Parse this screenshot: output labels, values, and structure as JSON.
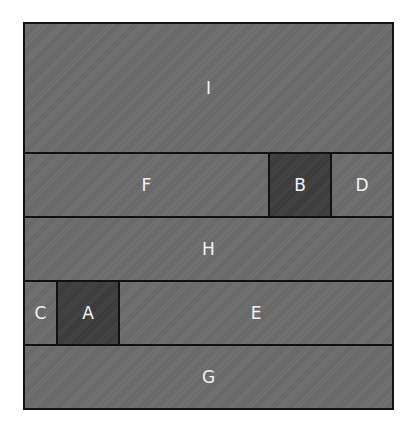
{
  "diagram": {
    "type": "rectangle-partition",
    "colors": {
      "light_block": "#6b6b6b",
      "dark_block": "#3b3b3b",
      "border": "#111111",
      "label": "#f2f2f2",
      "background": "#ffffff"
    },
    "rows": [
      {
        "blocks": [
          {
            "label": "I",
            "shade": "light"
          }
        ]
      },
      {
        "blocks": [
          {
            "label": "F",
            "shade": "light"
          },
          {
            "label": "B",
            "shade": "dark"
          },
          {
            "label": "D",
            "shade": "light"
          }
        ]
      },
      {
        "blocks": [
          {
            "label": "H",
            "shade": "light"
          }
        ]
      },
      {
        "blocks": [
          {
            "label": "C",
            "shade": "light"
          },
          {
            "label": "A",
            "shade": "dark"
          },
          {
            "label": "E",
            "shade": "light"
          }
        ]
      },
      {
        "blocks": [
          {
            "label": "G",
            "shade": "light"
          }
        ]
      }
    ]
  }
}
